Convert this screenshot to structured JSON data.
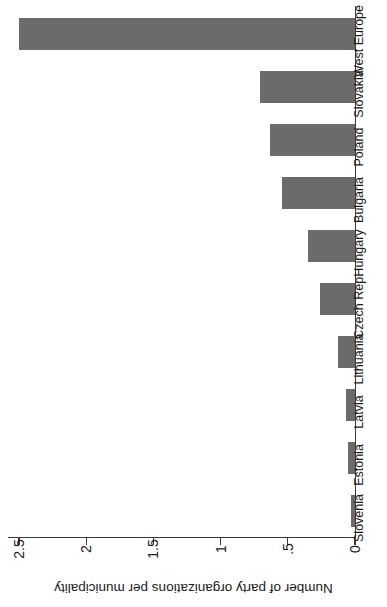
{
  "chart_data": {
    "type": "bar",
    "orientation": "vertical",
    "title": "",
    "xlabel": "",
    "ylabel": "Number of party organizations per municipality",
    "categories": [
      "Slovenia",
      "Estonia",
      "Latvia",
      "Lithuania",
      "Czech Rep.",
      "Hungary",
      "Bulgaria",
      "Poland",
      "Slovakia",
      "West Europe"
    ],
    "values": [
      0.03,
      0.05,
      0.07,
      0.13,
      0.26,
      0.35,
      0.54,
      0.63,
      0.71,
      2.5
    ],
    "ylim": [
      0,
      2.5
    ],
    "ytick_labels": [
      "0",
      ".5",
      "1",
      "1.5",
      "2",
      "2.5"
    ],
    "ytick_values": [
      0,
      0.5,
      1,
      1.5,
      2,
      2.5
    ],
    "grid": false,
    "legend": null,
    "bar_color": "#6b6b6b",
    "axis_color": "#3a3a3a",
    "background": "#ffffff"
  },
  "figure": {
    "rotation_note": "rendered sideways",
    "axis_title": "Number of party organizations per municipality"
  }
}
